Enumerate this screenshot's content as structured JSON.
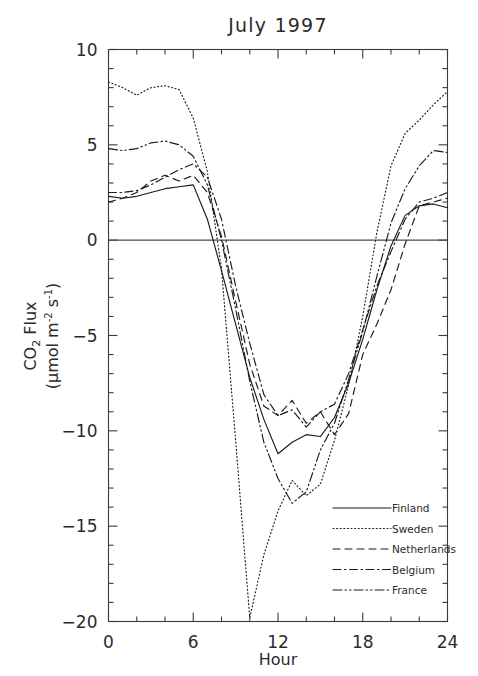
{
  "chart_data": {
    "type": "line",
    "title": "July 1997",
    "xlabel": "Hour",
    "ylabel": "CO2 Flux (umol m-2 s-1)",
    "ylabel_line1": "CO",
    "ylabel_line1_sub": "2",
    "ylabel_line1_rest": " Flux",
    "ylabel_line2_prefix": "(",
    "ylabel_line2_mu": "μmol m",
    "ylabel_line2_sup1": "-2",
    "ylabel_line2_mid": " s",
    "ylabel_line2_sup2": "-1",
    "ylabel_line2_suffix": ")",
    "xlim": [
      0,
      24
    ],
    "ylim": [
      -20,
      10
    ],
    "xticks": [
      0,
      6,
      12,
      18,
      24
    ],
    "xtick_labels": [
      "0",
      "6",
      "12",
      "18",
      "24"
    ],
    "yticks": [
      10,
      5,
      0,
      -5,
      -10,
      -15,
      -20
    ],
    "ytick_labels": [
      "10",
      "5",
      "0",
      "-5",
      "-10",
      "-15",
      "-20"
    ],
    "xminor_step": 2,
    "yminor_step": 1,
    "grid": false,
    "zero_line": true,
    "legend_position": "lower-right",
    "x": [
      0,
      1,
      2,
      3,
      4,
      5,
      6,
      7,
      8,
      9,
      10,
      11,
      12,
      13,
      14,
      15,
      16,
      17,
      18,
      19,
      20,
      21,
      22,
      23,
      24
    ],
    "series": [
      {
        "name": "Finland",
        "style": "solid",
        "dasharray": "none",
        "values": [
          2.3,
          2.2,
          2.3,
          2.5,
          2.7,
          2.8,
          2.9,
          1.1,
          -1.6,
          -4.4,
          -7.2,
          -9.4,
          -11.2,
          -10.6,
          -10.2,
          -10.3,
          -9.3,
          -7.5,
          -5.2,
          -2.6,
          -0.3,
          1.3,
          1.8,
          1.9,
          1.7
        ]
      },
      {
        "name": "Sweden",
        "style": "dotted",
        "dasharray": "1,2.6",
        "values": [
          8.3,
          8.0,
          7.6,
          8.0,
          8.1,
          7.9,
          6.4,
          3.6,
          -1.5,
          -10.5,
          -19.8,
          -16.5,
          -14.2,
          -12.6,
          -13.4,
          -12.8,
          -10.5,
          -7.6,
          -4.0,
          0.4,
          3.9,
          5.6,
          6.3,
          7.1,
          7.8
        ]
      },
      {
        "name": "Netherlands",
        "style": "dashed",
        "dasharray": "7,5",
        "values": [
          2.0,
          2.2,
          2.5,
          3.1,
          3.4,
          3.1,
          3.4,
          2.5,
          0.2,
          -3.2,
          -6.5,
          -8.7,
          -9.2,
          -8.4,
          -9.6,
          -9.0,
          -10.2,
          -9.1,
          -6.0,
          -4.4,
          -2.6,
          -0.2,
          1.8,
          2.0,
          2.2
        ]
      },
      {
        "name": "Belgium",
        "style": "dash-dot",
        "dasharray": "8,3.5,1.5,3.5",
        "values": [
          2.5,
          2.5,
          2.6,
          2.9,
          3.3,
          3.7,
          4.0,
          3.3,
          1.1,
          -2.4,
          -5.4,
          -8.1,
          -9.2,
          -8.9,
          -9.8,
          -9.0,
          -8.6,
          -7.0,
          -4.7,
          -2.4,
          -0.6,
          1.1,
          2.0,
          2.2,
          2.5
        ]
      },
      {
        "name": "France",
        "style": "dash-dot-dot",
        "dasharray": "9,3,1.5,3,1.5,3",
        "values": [
          4.8,
          4.7,
          4.8,
          5.1,
          5.2,
          5.0,
          4.4,
          2.9,
          0.0,
          -3.6,
          -7.4,
          -10.6,
          -12.5,
          -13.8,
          -13.2,
          -11.0,
          -9.6,
          -7.3,
          -4.8,
          -1.9,
          0.9,
          2.7,
          3.9,
          4.7,
          4.6
        ]
      }
    ],
    "legend": [
      {
        "label": "Finland",
        "dasharray": "none"
      },
      {
        "label": "Sweden",
        "dasharray": "1,2.6"
      },
      {
        "label": "Netherlands",
        "dasharray": "7,5"
      },
      {
        "label": "Belgium",
        "dasharray": "8,3.5,1.5,3.5"
      },
      {
        "label": "France",
        "dasharray": "9,3,1.5,3,1.5,3"
      }
    ],
    "colors": {
      "ink": "#1a1a1a",
      "axis": "#3a3a3a",
      "background": "#ffffff"
    }
  }
}
